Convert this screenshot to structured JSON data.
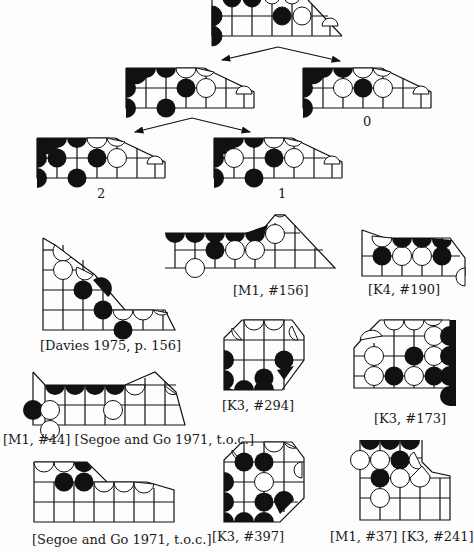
{
  "page": {
    "type": "book page scan",
    "content": "Go (baduk) endgame position diagrams with literature references"
  },
  "tree": {
    "root": {
      "id": "root"
    },
    "branches": [
      {
        "id": "left",
        "label": ""
      },
      {
        "id": "zero",
        "label": "0"
      },
      {
        "id": "two",
        "label": "2"
      },
      {
        "id": "one",
        "label": "1"
      }
    ]
  },
  "captions": {
    "zero": "0",
    "two": "2",
    "one": "1",
    "davies": "[Davies 1975, p. 156]",
    "m1_156": "[M1, #156]",
    "k4_190": "[K4, #190]",
    "k3_294": "[K3, #294]",
    "k3_173": "[K3, #173]",
    "m1_44": "[M1, #44] [Segoe and Go 1971, t.o.c.]",
    "segoe": "[Segoe and Go 1971, t.o.c.]",
    "k3_397": "[K3, #397]",
    "m1_37": "[M1, #37] [K3, #241]"
  },
  "colors": {
    "ink": "#111111",
    "paper": "#fdfdfd",
    "white_stone": "#ffffff",
    "black_stone": "#111111"
  }
}
